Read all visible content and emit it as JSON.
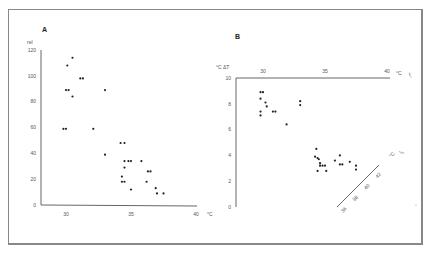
{
  "chart_data": [
    {
      "type": "scatter",
      "panel": "A",
      "title": "A",
      "xlabel": "°C",
      "ylabel": "rel",
      "x_ticks": [
        "30",
        "35",
        "40"
      ],
      "y_ticks": [
        "0",
        "20",
        "40",
        "60",
        "80",
        "100",
        "120"
      ],
      "xlim": [
        28,
        40
      ],
      "ylim": [
        0,
        120
      ],
      "grid": false,
      "points": [
        [
          30.5,
          114
        ],
        [
          30.1,
          108
        ],
        [
          31.1,
          98
        ],
        [
          31.3,
          98
        ],
        [
          30.0,
          89
        ],
        [
          30.2,
          89
        ],
        [
          30.5,
          84
        ],
        [
          33.0,
          89
        ],
        [
          29.8,
          59
        ],
        [
          30.0,
          59
        ],
        [
          32.1,
          59
        ],
        [
          33.0,
          39
        ],
        [
          34.2,
          48
        ],
        [
          34.5,
          48
        ],
        [
          34.5,
          34
        ],
        [
          34.8,
          34
        ],
        [
          35.0,
          34
        ],
        [
          35.8,
          34
        ],
        [
          34.5,
          29
        ],
        [
          34.3,
          22
        ],
        [
          34.3,
          18
        ],
        [
          34.5,
          18
        ],
        [
          36.2,
          18
        ],
        [
          36.3,
          26
        ],
        [
          36.5,
          26
        ],
        [
          35.0,
          12
        ],
        [
          36.9,
          13
        ],
        [
          37.0,
          9
        ],
        [
          37.5,
          9
        ]
      ]
    },
    {
      "type": "scatter",
      "panel": "B",
      "title": "B",
      "xlabel": "°C t_i",
      "ylabel": "°C ΔT",
      "x_ticks": [
        "30",
        "35",
        "40"
      ],
      "y_ticks": [
        "0",
        "2",
        "4",
        "6",
        "8",
        "10"
      ],
      "secondary_axis": {
        "label": "°C t_s",
        "ticks": [
          "36",
          "38",
          "40",
          "42"
        ],
        "orientation": "diagonal"
      },
      "xlim": [
        28,
        40
      ],
      "ylim": [
        0,
        10
      ],
      "grid": false,
      "points": [
        [
          29.8,
          8.9
        ],
        [
          30.0,
          8.9
        ],
        [
          29.8,
          8.4
        ],
        [
          30.2,
          8.1
        ],
        [
          30.3,
          7.8
        ],
        [
          29.8,
          7.4
        ],
        [
          29.8,
          7.1
        ],
        [
          30.8,
          7.4
        ],
        [
          31.0,
          7.4
        ],
        [
          31.9,
          6.4
        ],
        [
          33.0,
          8.2
        ],
        [
          33.0,
          7.9
        ],
        [
          34.3,
          4.5
        ],
        [
          34.2,
          3.9
        ],
        [
          34.4,
          3.8
        ],
        [
          34.5,
          3.7
        ],
        [
          34.6,
          3.4
        ],
        [
          34.6,
          3.2
        ],
        [
          34.8,
          3.2
        ],
        [
          35.0,
          3.2
        ],
        [
          34.4,
          2.8
        ],
        [
          35.1,
          2.8
        ],
        [
          35.8,
          3.6
        ],
        [
          36.2,
          4.0
        ],
        [
          36.2,
          3.3
        ],
        [
          36.4,
          3.3
        ],
        [
          37.0,
          3.5
        ],
        [
          37.5,
          3.2
        ],
        [
          37.5,
          2.9
        ]
      ]
    }
  ],
  "panels": {
    "a": {
      "title": "A",
      "y_unit": "rel",
      "y_ticks": [
        "120",
        "100",
        "80",
        "60",
        "40",
        "20",
        "0"
      ],
      "x_ticks": [
        "30",
        "35",
        "40"
      ],
      "x_unit": "°C"
    },
    "b": {
      "title": "B",
      "y_unit": "°C ΔT",
      "y_ticks": [
        "10",
        "8",
        "6",
        "4",
        "2",
        "0"
      ],
      "x_ticks": [
        "30",
        "35",
        "40"
      ],
      "x_unit": "°C",
      "x_var": "t",
      "x_sub": "i",
      "diag_ticks": [
        "36",
        "38",
        "40",
        "42"
      ],
      "diag_unit": "°C",
      "diag_var": "t",
      "diag_sub": "s"
    }
  }
}
